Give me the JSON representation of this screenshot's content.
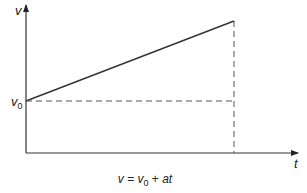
{
  "diagram": {
    "y_axis_label": "v",
    "x_axis_label": "t",
    "initial_velocity_label": "v",
    "initial_velocity_subscript": "0",
    "formula": {
      "lhs": "v",
      "eq": " = ",
      "v0": "v",
      "v0_sub": "0",
      "plus": " + ",
      "rhs": "at"
    },
    "colors": {
      "line": "#333333",
      "axis": "#333333",
      "dashed": "#555555"
    }
  }
}
